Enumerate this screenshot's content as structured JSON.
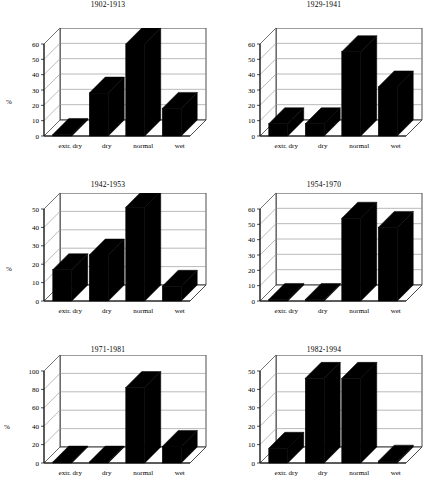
{
  "figure": {
    "axis_label": "%",
    "categories": [
      "extr. dry",
      "dry",
      "normal",
      "wet"
    ]
  },
  "chart_data": [
    {
      "type": "bar",
      "title": "1902-1913",
      "categories": [
        "extr. dry",
        "dry",
        "normal",
        "wet"
      ],
      "values": [
        1,
        28,
        60,
        18
      ],
      "xlabel": "",
      "ylabel": "%",
      "ylim": [
        0,
        60
      ],
      "yticks": [
        0,
        10,
        20,
        30,
        40,
        50,
        60
      ],
      "grid": true,
      "legend": "none",
      "style": "3d"
    },
    {
      "type": "bar",
      "title": "1929-1941",
      "categories": [
        "extr. dry",
        "dry",
        "normal",
        "wet"
      ],
      "values": [
        8,
        8,
        55,
        32
      ],
      "xlabel": "",
      "ylabel": "",
      "ylim": [
        0,
        60
      ],
      "yticks": [
        0,
        10,
        20,
        30,
        40,
        50,
        60
      ],
      "grid": true,
      "legend": "none",
      "style": "3d"
    },
    {
      "type": "bar",
      "title": "1942-1953",
      "categories": [
        "extr. dry",
        "dry",
        "normal",
        "wet"
      ],
      "values": [
        17,
        25,
        51,
        8
      ],
      "xlabel": "",
      "ylabel": "%",
      "ylim": [
        0,
        50
      ],
      "yticks": [
        0,
        10,
        20,
        30,
        40,
        50
      ],
      "grid": true,
      "legend": "none",
      "style": "3d"
    },
    {
      "type": "bar",
      "title": "1954-1970",
      "categories": [
        "extr. dry",
        "dry",
        "normal",
        "wet"
      ],
      "values": [
        1,
        1,
        54,
        48
      ],
      "xlabel": "",
      "ylabel": "",
      "ylim": [
        0,
        60
      ],
      "yticks": [
        0,
        10,
        20,
        30,
        40,
        50,
        60
      ],
      "grid": true,
      "legend": "none",
      "style": "3d"
    },
    {
      "type": "bar",
      "title": "1971-1981",
      "categories": [
        "extr. dry",
        "dry",
        "normal",
        "wet"
      ],
      "values": [
        1,
        1,
        82,
        18
      ],
      "xlabel": "",
      "ylabel": "%",
      "ylim": [
        0,
        100
      ],
      "yticks": [
        0,
        20,
        40,
        60,
        80,
        100
      ],
      "grid": true,
      "legend": "none",
      "style": "3d"
    },
    {
      "type": "bar",
      "title": "1982-1994",
      "categories": [
        "extr. dry",
        "dry",
        "normal",
        "wet"
      ],
      "values": [
        8,
        46,
        46,
        1
      ],
      "xlabel": "",
      "ylabel": "",
      "ylim": [
        0,
        50
      ],
      "yticks": [
        0,
        10,
        20,
        30,
        40,
        50
      ],
      "grid": true,
      "legend": "none",
      "style": "3d"
    }
  ],
  "colors": {
    "bar": "#000000",
    "axis": "#000000",
    "grid": "#8c8c8c",
    "background": "#ffffff"
  }
}
